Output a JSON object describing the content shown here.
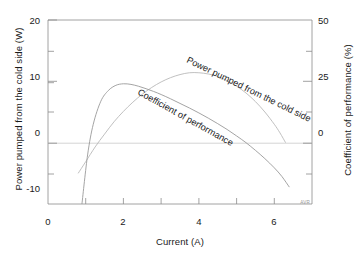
{
  "chart_data": {
    "type": "line",
    "title": "",
    "xlabel": "Current (A)",
    "ylabel": "Power pumped from the cold side (W)",
    "y2label": "Coefficient of performance (%)",
    "xlim": [
      0,
      7
    ],
    "ylim": [
      -10,
      20
    ],
    "y2lim": [
      -10,
      50
    ],
    "xticks": [
      0,
      2,
      4,
      6
    ],
    "xtick_labels": [
      "0",
      "2",
      "4",
      "6"
    ],
    "xminor_ticks": [
      1,
      3,
      5,
      7
    ],
    "yticks": [
      -10,
      0,
      10,
      20
    ],
    "ytick_labels": [
      "-10",
      "0",
      "10",
      "20"
    ],
    "yminor_ticks": [
      -5,
      5,
      15
    ],
    "y2ticks": [
      -10,
      0,
      25,
      50
    ],
    "y2tick_labels": [
      "",
      "0",
      "25",
      "50"
    ],
    "y2minor_ticks": [
      -5,
      12.5,
      37.5
    ],
    "grid": false,
    "legend_position": "inline-annotations",
    "corner_tag": "AVR",
    "annotations": [
      {
        "text": "Power pumped from the cold side",
        "curve": "power_pumped",
        "rotated": true
      },
      {
        "text": "Coefficient of performance",
        "curve": "coefficient_of_performance",
        "rotated": true
      }
    ],
    "series": [
      {
        "name": "Power pumped from the cold side",
        "axis": "left",
        "unit": "W",
        "color": "#b9b9b9",
        "x": [
          0.8,
          1.0,
          1.25,
          1.5,
          1.75,
          2.0,
          2.25,
          2.5,
          2.75,
          3.0,
          3.25,
          3.5,
          3.75,
          4.0,
          4.25,
          4.5,
          4.75,
          5.0,
          5.25,
          5.5,
          5.75,
          6.0,
          6.15,
          6.3
        ],
        "y": [
          -5.0,
          -3.1,
          -0.7,
          1.4,
          3.4,
          5.1,
          6.6,
          7.9,
          9.0,
          9.9,
          10.6,
          11.1,
          11.4,
          11.4,
          11.2,
          10.8,
          10.1,
          9.2,
          8.1,
          6.7,
          5.0,
          3.0,
          1.6,
          0.0
        ]
      },
      {
        "name": "Coefficient of performance",
        "axis": "right",
        "unit": "%",
        "color": "#9a9a9a",
        "x": [
          0.9,
          1.05,
          1.2,
          1.4,
          1.6,
          1.8,
          2.0,
          2.2,
          2.4,
          2.6,
          2.8,
          3.0,
          3.25,
          3.5,
          3.75,
          4.0,
          4.25,
          4.5,
          4.75,
          5.0,
          5.25,
          5.5,
          5.75,
          6.0,
          6.2,
          6.4
        ],
        "y": [
          -10.0,
          6.0,
          16.0,
          23.5,
          27.0,
          28.7,
          29.2,
          29.0,
          28.4,
          27.6,
          26.7,
          25.7,
          24.3,
          22.8,
          21.3,
          19.7,
          18.0,
          16.2,
          14.3,
          12.2,
          10.0,
          7.5,
          4.8,
          1.8,
          -1.0,
          -4.5
        ]
      }
    ]
  },
  "axes": {
    "left": {
      "label": "Power pumped from the cold side  (W)",
      "tick_labels": [
        "20",
        "10",
        "0",
        "-10"
      ]
    },
    "right": {
      "label": "Coefficient of performance (%)",
      "tick_labels": [
        "50",
        "25",
        "0"
      ]
    },
    "bottom": {
      "label": "Current (A)",
      "tick_labels": [
        "0",
        "2",
        "4",
        "6"
      ]
    }
  },
  "watermark": {
    "text": "AVR"
  }
}
